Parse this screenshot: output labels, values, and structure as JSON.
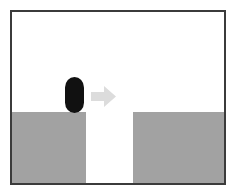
{
  "figure": {
    "name": "gap-crossing-scene",
    "width": 236,
    "height": 196,
    "background_color": "#ffffff",
    "frame": {
      "border_color": "#3b3b3b",
      "border_width": 2,
      "fill_color": "#ffffff"
    }
  },
  "scene": {
    "description": "Black capsule agent standing on the left grey platform with a light grey arrow pointing right toward a gap and a second grey platform.",
    "colors": {
      "platform": "#a2a2a2",
      "agent": "#111111",
      "arrow": "#dcdcdc",
      "background": "#ffffff",
      "frame": "#3b3b3b"
    },
    "platforms": [
      {
        "id": "platform-left",
        "label": "left platform",
        "color": "#a2a2a2",
        "x": 0,
        "y": 100,
        "width": 74,
        "height": 71
      },
      {
        "id": "platform-right",
        "label": "right platform",
        "color": "#a2a2a2",
        "x": 121,
        "y": 100,
        "width": 91,
        "height": 71
      }
    ],
    "gap": {
      "id": "gap-region",
      "label": "gap",
      "color": "#ffffff",
      "x": 74,
      "y": 100,
      "width": 47,
      "height": 71
    },
    "agent": {
      "id": "agent-capsule",
      "label": "capsule agent",
      "shape": "capsule",
      "color": "#111111",
      "x": 53,
      "y": 65,
      "width": 19,
      "height": 36
    },
    "arrow": {
      "id": "direction-arrow",
      "label": "motion direction arrow",
      "icon": "arrow-right-icon",
      "direction": "right",
      "color": "#dcdcdc",
      "x": 79,
      "y": 74,
      "width": 25,
      "height": 21
    }
  },
  "caption": "Capsule agent on left platform moving right across a gap"
}
